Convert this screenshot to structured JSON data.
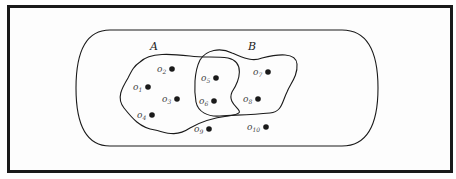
{
  "diagram": {
    "type": "venn",
    "universe": {
      "shape": "stadium"
    },
    "sets": [
      {
        "id": "A",
        "label": "A",
        "members": [
          "o1",
          "o2",
          "o3",
          "o4",
          "o5",
          "o6"
        ]
      },
      {
        "id": "B",
        "label": "B",
        "members": [
          "o5",
          "o6",
          "o7",
          "o8"
        ]
      }
    ],
    "points": [
      {
        "id": "o1",
        "base": "o",
        "sub": "1",
        "x": 148,
        "y": 87,
        "lx": 133,
        "ly": 90
      },
      {
        "id": "o2",
        "base": "o",
        "sub": "2",
        "x": 172,
        "y": 69,
        "lx": 157,
        "ly": 72
      },
      {
        "id": "o3",
        "base": "o",
        "sub": "3",
        "x": 177,
        "y": 99,
        "lx": 162,
        "ly": 102
      },
      {
        "id": "o4",
        "base": "o",
        "sub": "4",
        "x": 152,
        "y": 115,
        "lx": 137,
        "ly": 118
      },
      {
        "id": "o5",
        "base": "o",
        "sub": "5",
        "x": 216,
        "y": 78,
        "lx": 201,
        "ly": 81
      },
      {
        "id": "o6",
        "base": "o",
        "sub": "6",
        "x": 214,
        "y": 101,
        "lx": 199,
        "ly": 104
      },
      {
        "id": "o7",
        "base": "o",
        "sub": "7",
        "x": 268,
        "y": 72,
        "lx": 253,
        "ly": 75
      },
      {
        "id": "o8",
        "base": "o",
        "sub": "8",
        "x": 258,
        "y": 99,
        "lx": 243,
        "ly": 102
      },
      {
        "id": "o9",
        "base": "o",
        "sub": "9",
        "x": 209,
        "y": 129,
        "lx": 194,
        "ly": 132
      },
      {
        "id": "o10",
        "base": "o",
        "sub": "10",
        "x": 266,
        "y": 127,
        "lx": 247,
        "ly": 130
      }
    ],
    "colors": {
      "ink": "#1a1a1a",
      "background": "#ffffff"
    }
  }
}
